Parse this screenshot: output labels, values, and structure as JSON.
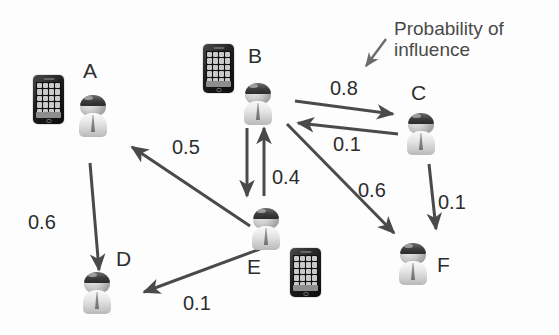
{
  "diagram": {
    "background_color": "#fdfdfd",
    "edge_color": "#4a4a4a",
    "text_color": "#2c2c2c",
    "annotation": {
      "line1": "Probability of",
      "line2": "influence",
      "pointer_icon": "arrow-down-left-icon"
    },
    "nodes": [
      {
        "id": "A",
        "label": "A",
        "label_x": 83,
        "label_y": 60,
        "person_x": 78,
        "person_y": 95,
        "has_phone": true,
        "phone_x": 33,
        "phone_y": 75
      },
      {
        "id": "B",
        "label": "B",
        "label_x": 248,
        "label_y": 45,
        "person_x": 243,
        "person_y": 83,
        "has_phone": true,
        "phone_x": 203,
        "phone_y": 44
      },
      {
        "id": "C",
        "label": "C",
        "label_x": 411,
        "label_y": 82,
        "person_x": 406,
        "person_y": 113,
        "has_phone": false,
        "phone_x": 0,
        "phone_y": 0
      },
      {
        "id": "D",
        "label": "D",
        "label_x": 116,
        "label_y": 248,
        "person_x": 82,
        "person_y": 272,
        "has_phone": false,
        "phone_x": 0,
        "phone_y": 0
      },
      {
        "id": "E",
        "label": "E",
        "label_x": 247,
        "label_y": 256,
        "person_x": 251,
        "person_y": 208,
        "has_phone": true,
        "phone_x": 290,
        "phone_y": 248
      },
      {
        "id": "F",
        "label": "F",
        "label_x": 437,
        "label_y": 254,
        "person_x": 398,
        "person_y": 243,
        "has_phone": false,
        "phone_x": 0,
        "phone_y": 0
      }
    ],
    "edges": [
      {
        "id": "B-C",
        "from": "B",
        "to": "C",
        "weight": "0.8",
        "label_x": 330,
        "label_y": 78,
        "x1": 295,
        "y1": 101,
        "x2": 393,
        "y2": 114
      },
      {
        "id": "C-B",
        "from": "C",
        "to": "B",
        "weight": "0.1",
        "label_x": 333,
        "label_y": 134,
        "x1": 398,
        "y1": 134,
        "x2": 298,
        "y2": 123
      },
      {
        "id": "B-E",
        "from": "B",
        "to": "E",
        "weight": "0.4",
        "label_x": 272,
        "label_y": 167,
        "x1": 247,
        "y1": 128,
        "x2": 247,
        "y2": 196
      },
      {
        "id": "E-B",
        "from": "E",
        "to": "B",
        "weight": "",
        "label_x": 0,
        "label_y": 0,
        "x1": 264,
        "y1": 196,
        "x2": 264,
        "y2": 128
      },
      {
        "id": "E-A",
        "from": "E",
        "to": "A",
        "weight": "0.5",
        "label_x": 172,
        "label_y": 137,
        "x1": 250,
        "y1": 226,
        "x2": 132,
        "y2": 147
      },
      {
        "id": "A-D",
        "from": "A",
        "to": "D",
        "weight": "0.6",
        "label_x": 28,
        "label_y": 212,
        "x1": 90,
        "y1": 163,
        "x2": 99,
        "y2": 270
      },
      {
        "id": "E-D",
        "from": "E",
        "to": "D",
        "weight": "0.1",
        "label_x": 183,
        "label_y": 293,
        "x1": 260,
        "y1": 249,
        "x2": 144,
        "y2": 292
      },
      {
        "id": "B-F",
        "from": "B",
        "to": "F",
        "weight": "0.6",
        "label_x": 358,
        "label_y": 180,
        "x1": 287,
        "y1": 124,
        "x2": 394,
        "y2": 233
      },
      {
        "id": "C-F",
        "from": "C",
        "to": "F",
        "weight": "0.1",
        "label_x": 438,
        "label_y": 192,
        "x1": 429,
        "y1": 164,
        "x2": 436,
        "y2": 229
      }
    ]
  }
}
